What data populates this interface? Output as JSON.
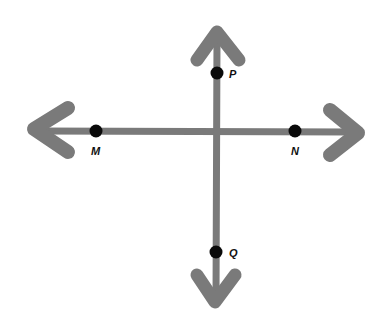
{
  "diagram": {
    "colors": {
      "line": "#7a7a7a",
      "point": "#0a0a0a",
      "background": "#ffffff"
    },
    "horizontal_line": {
      "x1": 30,
      "x2": 360,
      "y": 131
    },
    "vertical_line": {
      "x": 217,
      "y1": 30,
      "y2": 305
    },
    "points": [
      {
        "label": "P",
        "x": 217,
        "y": 73,
        "label_x": 229,
        "label_y": 78
      },
      {
        "label": "M",
        "x": 96,
        "y": 131,
        "label_x": 91,
        "label_y": 155
      },
      {
        "label": "N",
        "x": 295,
        "y": 131,
        "label_x": 291,
        "label_y": 155
      },
      {
        "label": "Q",
        "x": 216,
        "y": 252,
        "label_x": 229,
        "label_y": 257
      }
    ]
  }
}
